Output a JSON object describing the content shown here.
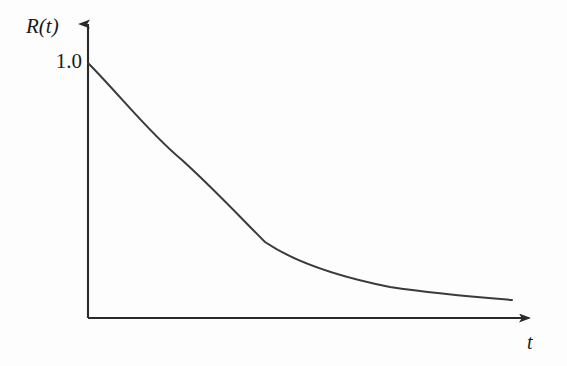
{
  "figure": {
    "background_color": "#fdfdfd",
    "line_color": "#3a3a3a",
    "axis_color": "#2a2a2a"
  },
  "axes": {
    "y_label": "R(t)",
    "x_label": "t",
    "y_tick_label": "1.0",
    "origin_px": [
      88,
      318
    ],
    "y_arrow_tip_px": [
      88,
      16
    ],
    "x_arrow_tip_px": [
      537,
      318
    ]
  },
  "chart_data": {
    "type": "line",
    "title": "",
    "xlabel": "t",
    "ylabel": "R(t)",
    "xlim": [
      0,
      1
    ],
    "ylim": [
      0,
      1.12
    ],
    "grid": false,
    "legend": "none",
    "annotations": [
      {
        "text": "1.0",
        "x": 0,
        "y": 1.0,
        "position": "y-axis-tick"
      },
      {
        "text": "R(t)",
        "position": "y-axis-end"
      },
      {
        "text": "t",
        "position": "x-axis-end"
      }
    ],
    "series": [
      {
        "name": "R(t)",
        "x": [
          0.0,
          0.05,
          0.1,
          0.15,
          0.2,
          0.25,
          0.3,
          0.35,
          0.4,
          0.45,
          0.5,
          0.55,
          0.6,
          0.65,
          0.7,
          0.75,
          0.8,
          0.85,
          0.9,
          0.945
        ],
        "y": [
          1.0,
          0.923,
          0.846,
          0.772,
          0.7,
          0.63,
          0.563,
          0.5,
          0.441,
          0.386,
          0.335,
          0.3,
          0.271,
          0.246,
          0.223,
          0.203,
          0.184,
          0.166,
          0.149,
          0.137
        ]
      }
    ],
    "svg_path": "M 88,63 C 118,93 150,134 182,160 C 214,189 243,220 265,242 C 296,263 340,277 390,287 C 430,293 475,297 512,300",
    "curve_points_px": [
      [
        88,
        63
      ],
      [
        120,
        95
      ],
      [
        140,
        127
      ],
      [
        180,
        158
      ],
      [
        220,
        212
      ],
      [
        260,
        240
      ],
      [
        265,
        242
      ],
      [
        300,
        256
      ],
      [
        340,
        271
      ],
      [
        380,
        283
      ],
      [
        420,
        290
      ],
      [
        460,
        295
      ],
      [
        512,
        300
      ]
    ]
  }
}
